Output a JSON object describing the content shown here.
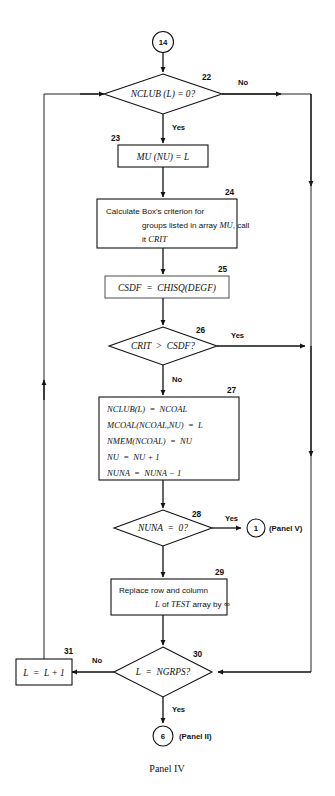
{
  "figure": {
    "caption": "Panel IV",
    "entry_connector": "14",
    "exit_connectors": [
      {
        "id": "1",
        "label": "(Panel V)"
      },
      {
        "id": "6",
        "label": "(Panel II)"
      }
    ]
  },
  "nodes": {
    "n22": {
      "number": "22",
      "type": "decision",
      "text": "NCLUB (L) = 0?",
      "yes_label": "Yes",
      "no_label": "No"
    },
    "n23": {
      "number": "23",
      "type": "process",
      "text": "MU (NU) = L"
    },
    "n24": {
      "number": "24",
      "type": "process",
      "line1a": "Calculate Box's criterion for",
      "line2a": "groups listed in array ",
      "line2b": "MU",
      "line2c": ", call",
      "line3a": "it ",
      "line3b": "CRIT"
    },
    "n25": {
      "number": "25",
      "type": "process",
      "text": "CSDF  =  CHISQ(DEGF)"
    },
    "n26": {
      "number": "26",
      "type": "decision",
      "text": "CRIT  >  CSDF?",
      "yes_label": "Yes",
      "no_label": "No"
    },
    "n27": {
      "number": "27",
      "type": "process",
      "line1": "NCLUB(L)  =  NCOAL",
      "line2": "MCOAL(NCOAL,NU)  =  L",
      "line3": "NMEM(NCOAL)  =  NU",
      "line4": "NU  =  NU + 1",
      "line5": "NUNA  =  NUNA − 1"
    },
    "n28": {
      "number": "28",
      "type": "decision",
      "text": "NUNA  =  0?",
      "yes_label": "Yes"
    },
    "n29": {
      "number": "29",
      "type": "process",
      "line1": "Replace row and column",
      "line2a": "L",
      "line2b": " of ",
      "line2c": "TEST",
      "line2d": " array by ",
      "line2e": "∞"
    },
    "n30": {
      "number": "30",
      "type": "decision",
      "text": "L  =  NGRPS?",
      "yes_label": "Yes",
      "no_label": "No"
    },
    "n31": {
      "number": "31",
      "type": "process",
      "text": "L  =  L + 1"
    }
  },
  "colors": {
    "ink": "#111111",
    "paper": "#ffffff",
    "box_stroke_light": "#3a3a3a"
  }
}
